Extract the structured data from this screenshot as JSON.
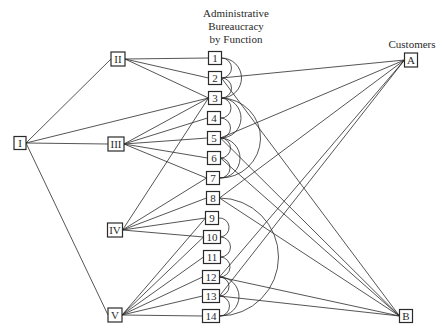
{
  "title_lines": [
    "Administrative",
    "Bureaucracy",
    "by Function"
  ],
  "customers_label": "Customers",
  "colors": {
    "ink": "#2a2a2a",
    "background": "#ffffff"
  },
  "nodes": {
    "I": {
      "label": "I",
      "x": 20,
      "y": 143,
      "w": 12,
      "h": 13
    },
    "II": {
      "label": "II",
      "x": 118,
      "y": 59,
      "w": 14,
      "h": 14
    },
    "III": {
      "label": "III",
      "x": 116,
      "y": 144,
      "w": 16,
      "h": 14
    },
    "IV": {
      "label": "IV",
      "x": 115,
      "y": 230,
      "w": 15,
      "h": 14
    },
    "V": {
      "label": "V",
      "x": 115,
      "y": 315,
      "w": 14,
      "h": 14
    },
    "1": {
      "label": "1",
      "x": 215,
      "y": 58,
      "w": 13,
      "h": 13
    },
    "2": {
      "label": "2",
      "x": 215,
      "y": 78,
      "w": 13,
      "h": 13
    },
    "3": {
      "label": "3",
      "x": 215,
      "y": 98,
      "w": 13,
      "h": 13
    },
    "4": {
      "label": "4",
      "x": 214,
      "y": 118,
      "w": 13,
      "h": 13
    },
    "5": {
      "label": "5",
      "x": 214,
      "y": 138,
      "w": 13,
      "h": 13
    },
    "6": {
      "label": "6",
      "x": 214,
      "y": 158,
      "w": 13,
      "h": 13
    },
    "7": {
      "label": "7",
      "x": 213,
      "y": 178,
      "w": 13,
      "h": 13
    },
    "8": {
      "label": "8",
      "x": 213,
      "y": 198,
      "w": 13,
      "h": 13
    },
    "9": {
      "label": "9",
      "x": 212,
      "y": 218,
      "w": 13,
      "h": 13
    },
    "10": {
      "label": "10",
      "x": 212,
      "y": 237,
      "w": 17,
      "h": 13
    },
    "11": {
      "label": "11",
      "x": 212,
      "y": 257,
      "w": 17,
      "h": 13
    },
    "12": {
      "label": "12",
      "x": 211,
      "y": 277,
      "w": 17,
      "h": 13
    },
    "13": {
      "label": "13",
      "x": 211,
      "y": 296,
      "w": 17,
      "h": 13
    },
    "14": {
      "label": "14",
      "x": 211,
      "y": 316,
      "w": 17,
      "h": 13
    },
    "A": {
      "label": "A",
      "x": 411,
      "y": 60,
      "w": 13,
      "h": 14
    },
    "B": {
      "label": "B",
      "x": 406,
      "y": 316,
      "w": 13,
      "h": 13
    }
  },
  "edges": [
    [
      "I",
      "II"
    ],
    [
      "I",
      "III"
    ],
    [
      "I",
      "V"
    ],
    [
      "I",
      "3"
    ],
    [
      "II",
      "1"
    ],
    [
      "II",
      "2"
    ],
    [
      "II",
      "3"
    ],
    [
      "III",
      "3"
    ],
    [
      "III",
      "4"
    ],
    [
      "III",
      "5"
    ],
    [
      "III",
      "6"
    ],
    [
      "III",
      "7"
    ],
    [
      "IV",
      "3"
    ],
    [
      "IV",
      "7"
    ],
    [
      "IV",
      "8"
    ],
    [
      "IV",
      "9"
    ],
    [
      "IV",
      "10"
    ],
    [
      "V",
      "9"
    ],
    [
      "V",
      "10"
    ],
    [
      "V",
      "11"
    ],
    [
      "V",
      "12"
    ],
    [
      "V",
      "13"
    ],
    [
      "V",
      "14"
    ],
    [
      "A",
      "2"
    ],
    [
      "A",
      "5"
    ],
    [
      "A",
      "8"
    ],
    [
      "A",
      "12"
    ],
    [
      "A",
      "13"
    ],
    [
      "B",
      "2"
    ],
    [
      "B",
      "5"
    ],
    [
      "B",
      "6"
    ],
    [
      "B",
      "8"
    ],
    [
      "B",
      "12"
    ],
    [
      "B",
      "13"
    ]
  ],
  "arcs": [
    [
      "1",
      "2"
    ],
    [
      "1",
      "3"
    ],
    [
      "2",
      "3"
    ],
    [
      "3",
      "4"
    ],
    [
      "3",
      "5"
    ],
    [
      "3",
      "7"
    ],
    [
      "4",
      "5"
    ],
    [
      "5",
      "6"
    ],
    [
      "5",
      "7"
    ],
    [
      "6",
      "7"
    ],
    [
      "8",
      "14"
    ],
    [
      "9",
      "10"
    ],
    [
      "10",
      "11"
    ],
    [
      "11",
      "12"
    ],
    [
      "12",
      "13"
    ],
    [
      "12",
      "14"
    ],
    [
      "13",
      "14"
    ]
  ]
}
